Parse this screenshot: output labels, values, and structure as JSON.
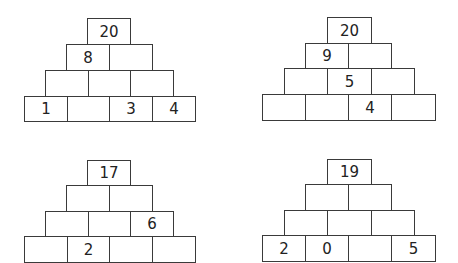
{
  "pyramids": [
    {
      "id": "top-left",
      "rows": [
        [
          "20"
        ],
        [
          "8",
          ""
        ],
        [
          "",
          "",
          ""
        ],
        [
          "1",
          "",
          "3",
          "4"
        ]
      ]
    },
    {
      "id": "top-right",
      "rows": [
        [
          "20"
        ],
        [
          "9",
          ""
        ],
        [
          "",
          "5",
          ""
        ],
        [
          "",
          "",
          "4",
          ""
        ]
      ]
    },
    {
      "id": "bottom-left",
      "rows": [
        [
          "17"
        ],
        [
          "",
          ""
        ],
        [
          "",
          "",
          "6"
        ],
        [
          "",
          "2",
          "",
          ""
        ]
      ]
    },
    {
      "id": "bottom-right",
      "rows": [
        [
          "19"
        ],
        [
          "",
          ""
        ],
        [
          "",
          "",
          ""
        ],
        [
          "2",
          "0",
          "",
          "5"
        ]
      ]
    }
  ]
}
